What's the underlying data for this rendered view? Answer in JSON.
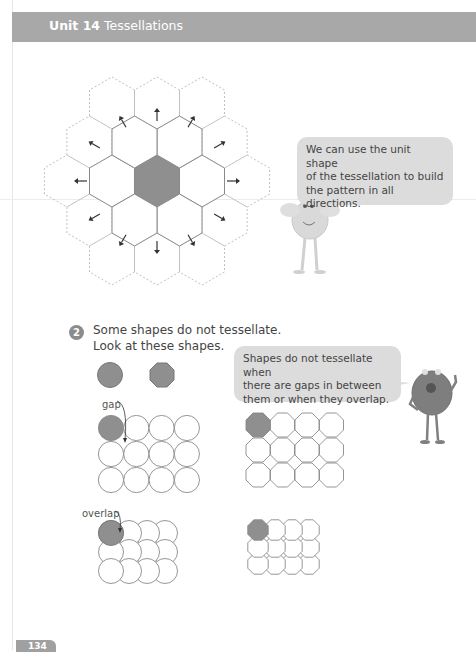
{
  "header": {
    "unit_label": "Unit 14",
    "unit_title": "Tessellations"
  },
  "figure1": {
    "description": "hexagon tessellation with shaded unit shape in center and arrows pointing outward in all directions",
    "unit_shape": "hexagon",
    "shaded_color": "#8f8f8f",
    "arrow_count": 12
  },
  "speech_bubble_1": {
    "text": "We can use the unit shape of the tessellation to build the pattern in all directions.",
    "lines": [
      "We can use the unit shape",
      "of the tessellation to build",
      "the pattern in all directions."
    ]
  },
  "question": {
    "number": "2",
    "line1": "Some shapes do not tessellate.",
    "line2": "Look at these shapes."
  },
  "speech_bubble_2": {
    "text": "Shapes do not tessellate when there are gaps in between them or when they overlap.",
    "lines": [
      "Shapes do not tessellate when",
      "there are gaps in between",
      "them or when they overlap."
    ]
  },
  "labels": {
    "gap": "gap",
    "overlap": "overlap"
  },
  "shapes": {
    "sample": [
      "circle",
      "octagon"
    ],
    "grids": [
      {
        "shape": "circle",
        "arrangement": "gap",
        "rows": 3,
        "cols": 4
      },
      {
        "shape": "octagon",
        "arrangement": "gap",
        "rows": 3,
        "cols": 4
      },
      {
        "shape": "circle",
        "arrangement": "overlap",
        "rows": 3,
        "cols": 4
      },
      {
        "shape": "octagon",
        "arrangement": "overlap",
        "rows": 3,
        "cols": 4
      }
    ]
  },
  "footer": {
    "page_number": "134"
  },
  "colors": {
    "header_bg": "#a8a8a8",
    "bubble_bg": "#dcdcdc",
    "shaded": "#8f8f8f",
    "outline": "#9a9a9a"
  }
}
